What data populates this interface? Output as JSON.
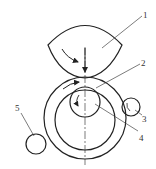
{
  "caption_fragment": "",
  "figure": {
    "labels": [
      {
        "id": "1",
        "text": "1",
        "part": "upper-roller"
      },
      {
        "id": "2",
        "text": "2",
        "part": "outer-ring"
      },
      {
        "id": "3",
        "text": "3",
        "part": "small-roller-right"
      },
      {
        "id": "4",
        "text": "4",
        "part": "inner-roller"
      },
      {
        "id": "5",
        "text": "5",
        "part": "small-roller-left"
      }
    ]
  }
}
